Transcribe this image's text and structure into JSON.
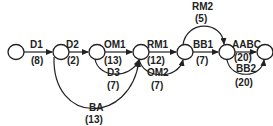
{
  "diagram": {
    "type": "activity-on-arrow network",
    "nodes": [
      {
        "id": "n1",
        "x": 16,
        "y": 52
      },
      {
        "id": "n2",
        "x": 61,
        "y": 52
      },
      {
        "id": "n3",
        "x": 97,
        "y": 52
      },
      {
        "id": "n4",
        "x": 141,
        "y": 52
      },
      {
        "id": "n5",
        "x": 185,
        "y": 52
      },
      {
        "id": "n6",
        "x": 227,
        "y": 52
      },
      {
        "id": "n7",
        "x": 265,
        "y": 52
      }
    ],
    "edges": [
      {
        "name": "D1",
        "duration": "(8)",
        "from": "n1",
        "to": "n2"
      },
      {
        "name": "D2",
        "duration": "(2)",
        "from": "n2",
        "to": "n3"
      },
      {
        "name": "OM1",
        "duration": "(13)",
        "from": "n3",
        "to": "n4"
      },
      {
        "name": "D3",
        "duration": "(7)",
        "from": "n3",
        "to": "n4"
      },
      {
        "name": "BA",
        "duration": "(13)",
        "from": "n2",
        "to": "n4"
      },
      {
        "name": "RM1",
        "duration": "(12)",
        "from": "n4",
        "to": "n5"
      },
      {
        "name": "OM2",
        "duration": "(7)",
        "from": "n4",
        "to": "n5"
      },
      {
        "name": "RM2",
        "duration": "(5)",
        "from": "n5",
        "to": "n6"
      },
      {
        "name": "BB1",
        "duration": "(7)",
        "from": "n5",
        "to": "n6"
      },
      {
        "name": "AABC",
        "duration": "(20)",
        "from": "n6",
        "to": "n7"
      },
      {
        "name": "BB2",
        "duration": "(20)",
        "from": "n6",
        "to": "n7"
      }
    ]
  }
}
